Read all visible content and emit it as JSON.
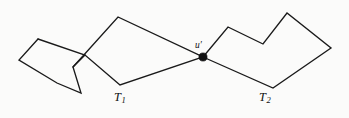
{
  "figure": {
    "canvas": {
      "width": 349,
      "height": 118,
      "background": "#fbfbfa"
    },
    "stroke_color": "#1a1a1a",
    "vertex_color": "#111111",
    "labels": {
      "t1": {
        "base": "T",
        "sub": "1",
        "x": 114,
        "y": 91
      },
      "t2": {
        "base": "T",
        "sub": "2",
        "x": 259,
        "y": 91
      },
      "u_prime": {
        "base": "u′",
        "x": 195,
        "y": 41
      }
    },
    "shapes": {
      "left_quad": {
        "name": "left-quadrilateral",
        "points": "38,39 19,60 57,83 81,93 73,67 85,55"
      },
      "t1_polygon": {
        "name": "tree-t1-polygon",
        "points": "73,67 118,17 203,57 120,85 85,55 38,39"
      },
      "t2_polygon": {
        "name": "tree-t2-polygon",
        "points": "203,57 228,27 263,44 287,13 331,48 273,88 203,57"
      }
    },
    "vertex": {
      "name": "vertex-u-prime",
      "cx": 203,
      "cy": 57,
      "r": 4.1
    }
  }
}
